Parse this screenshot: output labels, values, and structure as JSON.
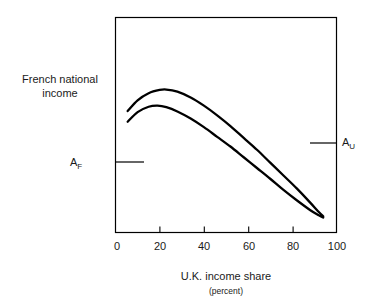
{
  "chart_data": {
    "type": "line",
    "title": "",
    "xlabel": "U.K. income share",
    "xlabel_sub": "(percent)",
    "ylabel": "French national income",
    "ylabel_lines": [
      "French national",
      "income"
    ],
    "xlim": [
      0,
      100
    ],
    "ylim": [
      0,
      100
    ],
    "grid": false,
    "legend": "none",
    "xticks": [
      0,
      20,
      40,
      60,
      80,
      100
    ],
    "xtick_labels": [
      "0",
      "20",
      "40",
      "60",
      "80",
      "100"
    ],
    "yticks": [],
    "ytick_labels": [],
    "series": [
      {
        "name": "upper curve",
        "x": [
          5.5,
          10,
          15,
          20,
          23,
          28,
          34,
          40,
          46,
          52,
          58,
          64,
          70,
          76,
          82,
          88,
          92,
          94
        ],
        "values": [
          56.5,
          61.5,
          64.8,
          66.3,
          66.5,
          65.5,
          62.8,
          59.0,
          54.5,
          49.5,
          44.0,
          38.5,
          32.5,
          26.5,
          20.5,
          14.0,
          9.5,
          7.5
        ]
      },
      {
        "name": "lower curve",
        "x": [
          5.5,
          10,
          15,
          19,
          23,
          28,
          34,
          40,
          46,
          52,
          58,
          64,
          70,
          76,
          82,
          88,
          92,
          94
        ],
        "values": [
          51.5,
          56.0,
          58.5,
          59.0,
          58.3,
          56.3,
          53.0,
          49.0,
          44.5,
          40.0,
          35.0,
          30.0,
          25.0,
          19.8,
          15.0,
          10.5,
          8.0,
          7.0
        ]
      }
    ],
    "annotations": [
      {
        "name": "A_F",
        "label": "A",
        "subscript": "F",
        "axis": "left",
        "value": 33,
        "description": "tick mark on left axis extending into plot"
      },
      {
        "name": "A_U",
        "label": "A",
        "subscript": "U",
        "axis": "right",
        "value": 42,
        "description": "tick mark on right axis extending into plot"
      }
    ],
    "colors": {
      "line": "#000000",
      "axis": "#000000",
      "text": "#1a1a1a",
      "background": "#ffffff"
    }
  }
}
